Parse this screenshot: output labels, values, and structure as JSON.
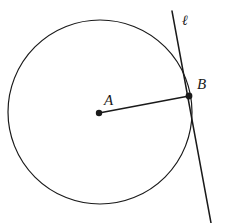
{
  "figure": {
    "type": "geometry-diagram",
    "background_color": "#ffffff",
    "stroke_color": "#1a1a1a",
    "width": 225,
    "height": 223
  },
  "labels": {
    "center_point": "A",
    "tangent_point": "B",
    "tangent_line": "ℓ"
  },
  "elements": {
    "circle": {
      "name": "circle",
      "center_x": 100,
      "center_y": 112,
      "radius": 92,
      "stroke_width": 1.2,
      "fill": "none"
    },
    "center_dot": {
      "name": "point-a-dot",
      "x": 99,
      "y": 113,
      "radius": 3.2
    },
    "tangent_dot": {
      "name": "point-b-dot",
      "x": 189,
      "y": 96,
      "radius": 3.4
    },
    "radius_segment": {
      "name": "radius-ab",
      "x1": 99,
      "y1": 113,
      "x2": 189,
      "y2": 96,
      "stroke_width": 1.5
    },
    "tangent_line": {
      "name": "tangent-line-ell",
      "x1": 172,
      "y1": 11,
      "x2": 211,
      "y2": 223,
      "stroke_width": 1.5
    }
  }
}
